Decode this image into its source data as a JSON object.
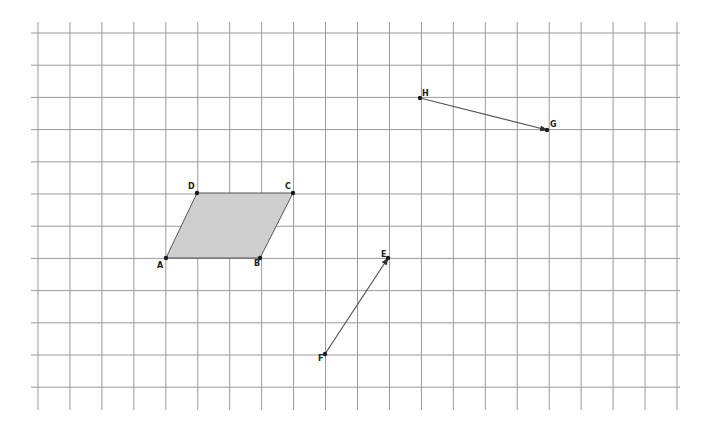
{
  "grid": {
    "x_start": 38,
    "x_step": 31.95,
    "x_count": 21,
    "y_start": 33,
    "y_step": 32.2,
    "y_count": 12,
    "v_top": 22,
    "v_bottom": 410,
    "h_left": 31,
    "h_right": 680,
    "line_color": "#9a9a9a"
  },
  "parallelogram": {
    "fill": "#cfcfcf",
    "vertices": [
      {
        "label": "A",
        "x": 166,
        "y": 258,
        "lx": 157,
        "ly": 262
      },
      {
        "label": "B",
        "x": 260,
        "y": 258,
        "lx": 254,
        "ly": 260
      },
      {
        "label": "C",
        "x": 293,
        "y": 193,
        "lx": 285,
        "ly": 183
      },
      {
        "label": "D",
        "x": 197,
        "y": 193,
        "lx": 188,
        "ly": 183
      }
    ]
  },
  "vectors": [
    {
      "name": "HG",
      "from": {
        "label": "H",
        "x": 420,
        "y": 98,
        "lx": 422,
        "ly": 90
      },
      "to": {
        "label": "G",
        "x": 547,
        "y": 130,
        "lx": 550,
        "ly": 121
      }
    },
    {
      "name": "FE",
      "from": {
        "label": "F",
        "x": 325,
        "y": 354,
        "lx": 318,
        "ly": 355
      },
      "to": {
        "label": "E",
        "x": 388,
        "y": 258,
        "lx": 381,
        "ly": 251
      }
    }
  ]
}
